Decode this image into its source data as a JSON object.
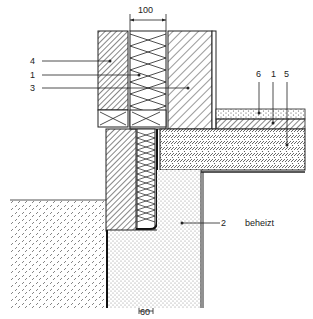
{
  "diagram": {
    "type": "construction-section-detail",
    "dimensions": {
      "top": "100",
      "bottom": "60"
    },
    "callouts": [
      {
        "id": "4",
        "label": "4"
      },
      {
        "id": "1a",
        "label": "1"
      },
      {
        "id": "3",
        "label": "3"
      },
      {
        "id": "6",
        "label": "6"
      },
      {
        "id": "1b",
        "label": "1"
      },
      {
        "id": "5",
        "label": "5"
      },
      {
        "id": "2",
        "label": "2"
      }
    ],
    "annotation": "beheizt",
    "colors": {
      "ink": "#222222",
      "background": "#ffffff"
    }
  }
}
